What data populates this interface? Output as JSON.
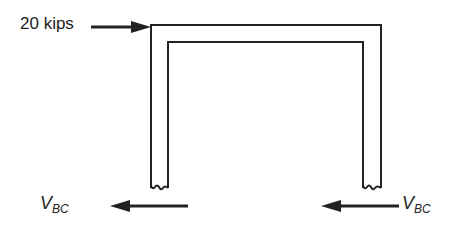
{
  "diagram": {
    "type": "free-body diagram of portal frame",
    "applied_load": {
      "label": "20 kips",
      "direction": "right",
      "location": "top-left corner of frame"
    },
    "reactions": [
      {
        "symbol": "V",
        "subscript": "BC",
        "direction": "left",
        "location": "below left column"
      },
      {
        "symbol": "V",
        "subscript": "BC",
        "direction": "left",
        "location": "below right column"
      }
    ],
    "members": [
      "left column (cut)",
      "beam",
      "right column (cut)"
    ],
    "colors": {
      "line": "#222222",
      "background": "#ffffff"
    }
  }
}
